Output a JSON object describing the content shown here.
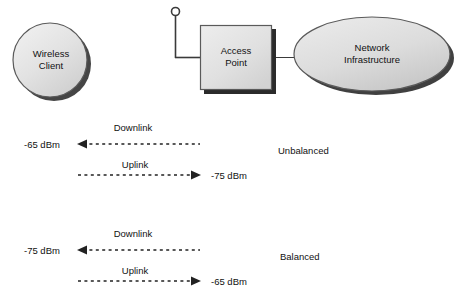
{
  "diagram": {
    "nodes": [
      {
        "id": "wireless-client",
        "label": "Wireless\nClient",
        "shape": "circle",
        "fill": "#e3e3e3"
      },
      {
        "id": "access-point",
        "label": "Access\nPoint",
        "shape": "rectangle",
        "fill": "#e0e0e0"
      },
      {
        "id": "network-infrastructure",
        "label": "Network\nInfrastructure",
        "shape": "ellipse",
        "fill": "#dcdcdc"
      }
    ],
    "antenna": {
      "name": "antenna-icon"
    },
    "scenarios": [
      {
        "id": "unbalanced",
        "state_label": "Unbalanced",
        "downlink": {
          "label": "Downlink",
          "value": "-65 dBm",
          "direction": "left"
        },
        "uplink": {
          "label": "Uplink",
          "value": "-75 dBm",
          "direction": "right"
        }
      },
      {
        "id": "balanced",
        "state_label": "Balanced",
        "downlink": {
          "label": "Downlink",
          "value": "-75 dBm",
          "direction": "left"
        },
        "uplink": {
          "label": "Uplink",
          "value": "-65 dBm",
          "direction": "right"
        }
      }
    ],
    "colors": {
      "shape_fill": "#e0e0e0",
      "shape_stroke": "#555555",
      "shadow": "#2b2b2b",
      "line": "#333333",
      "text": "#111111",
      "background": "#ffffff"
    }
  }
}
